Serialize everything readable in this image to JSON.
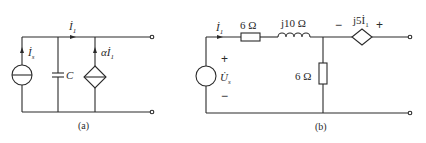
{
  "figure": {
    "circuit_a": {
      "caption": "(a)",
      "current_source_label": "İ",
      "current_source_sub": "s",
      "branch_current_label": "İ",
      "branch_current_sub": "1",
      "capacitor_label": "C",
      "dependent_source_label": "αİ",
      "dependent_source_sub": "1"
    },
    "circuit_b": {
      "caption": "(b)",
      "source_label": "U̇",
      "source_sub": "s",
      "source_plus": "+",
      "source_minus": "−",
      "current_label": "İ",
      "current_sub": "1",
      "series_resistor": "6 Ω",
      "inductor": "j10 Ω",
      "shunt_resistor": "6 Ω",
      "dependent_source_label": "j5İ",
      "dependent_source_sub": "1",
      "dep_minus": "−",
      "dep_plus": "+"
    },
    "colors": {
      "ink": "#2a2a2a",
      "background": "#ffffff"
    }
  }
}
